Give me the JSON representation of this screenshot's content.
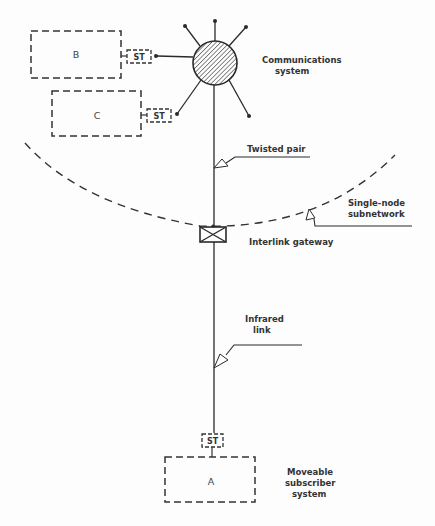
{
  "diagram": {
    "type": "network-topology",
    "nodes": {
      "box_b": {
        "label": "B",
        "terminal": "ST"
      },
      "box_c": {
        "label": "C",
        "terminal": "ST"
      },
      "box_a": {
        "label": "A",
        "terminal": "ST"
      },
      "hub": {
        "label_line1": "Communications",
        "label_line2": "system"
      },
      "gateway": {
        "label": "Interlink gateway"
      }
    },
    "annotations": {
      "twisted_pair": "Twisted pair",
      "subnetwork_line1": "Single-node",
      "subnetwork_line2": "subnetwork",
      "infrared_line1": "Infrared",
      "infrared_line2": "link",
      "moveable_line1": "Moveable",
      "moveable_line2": "subscriber",
      "moveable_line3": "system"
    },
    "colors": {
      "line": "#2a2a2a",
      "background": "#fdfdfd"
    }
  }
}
